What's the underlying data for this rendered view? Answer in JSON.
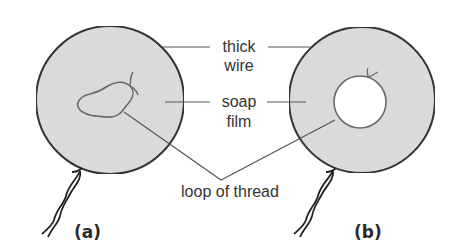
{
  "diagram": {
    "labels": {
      "thick_wire_line1": "thick",
      "thick_wire_line2": "wire",
      "soap_film_line1": "soap",
      "soap_film_line2": "film",
      "loop_of_thread": "loop of thread"
    },
    "panels": [
      {
        "id": "a",
        "caption": "(a)",
        "description": "wire ring with soap film; thread loop floats loosely on film"
      },
      {
        "id": "b",
        "caption": "(b)",
        "description": "film inside thread loop broken; thread pulled into a circle"
      }
    ],
    "colors": {
      "film": "#dcdcdc",
      "wire": "#222222",
      "thread": "#6a6a6a",
      "leader": "#555555",
      "text": "#333333"
    }
  }
}
